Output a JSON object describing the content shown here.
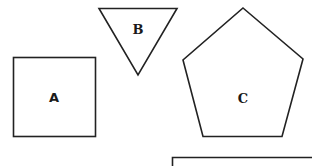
{
  "diagram": {
    "title": "",
    "shapes": [
      {
        "id": "A",
        "type": "square",
        "label": "A"
      },
      {
        "id": "B",
        "type": "inverted-triangle",
        "label": "B"
      },
      {
        "id": "C",
        "type": "pentagon",
        "label": "C"
      }
    ],
    "answer_box": {
      "type": "empty-box",
      "label": ""
    },
    "colors": {
      "stroke": "#222222",
      "background": "#ffffff",
      "text": "#1a1a1a"
    }
  }
}
